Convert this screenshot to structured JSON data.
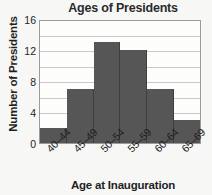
{
  "chart_data": {
    "type": "bar",
    "title": "Ages of Presidents",
    "subtitle": "",
    "xlabel": "Age at Inauguration",
    "ylabel": "Number of Presidents",
    "categories": [
      "40–44",
      "45–49",
      "50–54",
      "55–59",
      "60–64",
      "65–69"
    ],
    "values": [
      2,
      7,
      13,
      12,
      7,
      3
    ],
    "ylim": [
      0,
      16
    ],
    "yticks": [
      16,
      12,
      8,
      4,
      0
    ],
    "yticks_minor_step": 2,
    "grid": true,
    "legend": "none",
    "bar_gap": 0,
    "colors": {
      "bar": "#565656",
      "bar_edge": "#3f3f3f",
      "plot_background": "#fdfdfc",
      "page_background": "#f7f7f5",
      "gridline": "#c9c9c9",
      "axis_border": "#9a9a9a",
      "title_text": "#2b2b2b",
      "label_text": "#1f1f1f"
    }
  }
}
